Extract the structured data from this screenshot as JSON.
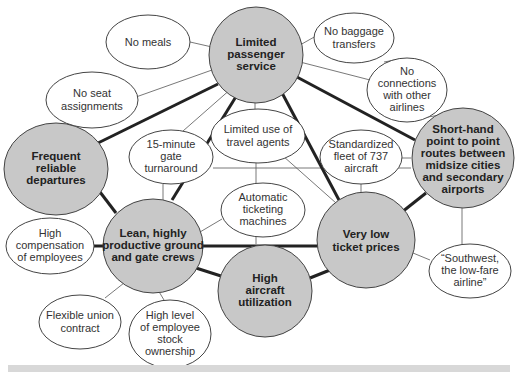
{
  "diagram": {
    "type": "activity-system-map",
    "colors": {
      "core_fill": "#c8c8c8",
      "support_fill": "#ffffff",
      "strong_link": "#222222",
      "weak_link": "#555555",
      "bottom_band": "#d8d8d8"
    },
    "nodes": {
      "limited_passenger_service": {
        "lines": [
          "Limited",
          "passenger",
          "service"
        ],
        "kind": "core"
      },
      "no_meals": {
        "lines": [
          "No meals"
        ],
        "kind": "support"
      },
      "no_baggage_transfers": {
        "lines": [
          "No baggage",
          "transfers"
        ],
        "kind": "support"
      },
      "no_connections": {
        "lines": [
          "No",
          "connections",
          "with other",
          "airlines"
        ],
        "kind": "support"
      },
      "no_seat_assignments": {
        "lines": [
          "No seat",
          "assignments"
        ],
        "kind": "support"
      },
      "frequent_reliable_departures": {
        "lines": [
          "Frequent",
          "reliable",
          "departures"
        ],
        "kind": "core"
      },
      "gate_turnaround": {
        "lines": [
          "15-minute",
          "gate",
          "turnaround"
        ],
        "kind": "support"
      },
      "limited_travel_agents": {
        "lines": [
          "Limited use of",
          "travel agents"
        ],
        "kind": "support"
      },
      "standardized_fleet": {
        "lines": [
          "Standardized",
          "fleet of 737",
          "aircraft"
        ],
        "kind": "support"
      },
      "short_haul_routes": {
        "lines": [
          "Short-hand",
          "point to point",
          "routes between",
          "midsize cities",
          "and secondary",
          "airports"
        ],
        "kind": "core"
      },
      "automatic_ticketing": {
        "lines": [
          "Automatic",
          "ticketing",
          "machines"
        ],
        "kind": "support"
      },
      "high_compensation": {
        "lines": [
          "High",
          "compensation",
          "of employees"
        ],
        "kind": "support"
      },
      "lean_crews": {
        "lines": [
          "Lean, highly",
          "productive ground",
          "and gate crews"
        ],
        "kind": "core"
      },
      "very_low_prices": {
        "lines": [
          "Very low",
          "ticket prices"
        ],
        "kind": "core"
      },
      "high_utilization": {
        "lines": [
          "High",
          "aircraft",
          "utilization"
        ],
        "kind": "core"
      },
      "southwest_slogan": {
        "lines": [
          "“Southwest,",
          "the low-fare",
          "airline”"
        ],
        "kind": "support"
      },
      "flexible_union": {
        "lines": [
          "Flexible union",
          "contract"
        ],
        "kind": "support"
      },
      "stock_ownership": {
        "lines": [
          "High level",
          "of employee",
          "stock",
          "ownership"
        ],
        "kind": "support"
      }
    },
    "edges": [
      {
        "from": "limited_passenger_service",
        "to": "frequent_reliable_departures",
        "weight": "strong"
      },
      {
        "from": "limited_passenger_service",
        "to": "lean_crews",
        "weight": "strong"
      },
      {
        "from": "limited_passenger_service",
        "to": "very_low_prices",
        "weight": "strong"
      },
      {
        "from": "limited_passenger_service",
        "to": "short_haul_routes",
        "weight": "strong"
      },
      {
        "from": "frequent_reliable_departures",
        "to": "lean_crews",
        "weight": "strong"
      },
      {
        "from": "lean_crews",
        "to": "very_low_prices",
        "weight": "strong"
      },
      {
        "from": "lean_crews",
        "to": "high_utilization",
        "weight": "strong"
      },
      {
        "from": "high_utilization",
        "to": "very_low_prices",
        "weight": "strong"
      },
      {
        "from": "very_low_prices",
        "to": "short_haul_routes",
        "weight": "strong"
      },
      {
        "from": "lean_crews",
        "to": "high_compensation",
        "weight": "strong"
      },
      {
        "from": "limited_passenger_service",
        "to": "no_meals",
        "weight": "weak"
      },
      {
        "from": "limited_passenger_service",
        "to": "no_seat_assignments",
        "weight": "weak"
      },
      {
        "from": "limited_passenger_service",
        "to": "no_baggage_transfers",
        "weight": "weak"
      },
      {
        "from": "limited_passenger_service",
        "to": "no_connections",
        "weight": "weak"
      },
      {
        "from": "limited_passenger_service",
        "to": "gate_turnaround",
        "weight": "weak"
      },
      {
        "from": "limited_passenger_service",
        "to": "limited_travel_agents",
        "weight": "weak"
      },
      {
        "from": "no_baggage_transfers",
        "to": "no_connections",
        "weight": "weak"
      },
      {
        "from": "no_connections",
        "to": "short_haul_routes",
        "weight": "weak"
      },
      {
        "from": "gate_turnaround",
        "to": "short_haul_routes",
        "weight": "weak"
      },
      {
        "from": "gate_turnaround",
        "to": "lean_crews",
        "weight": "weak"
      },
      {
        "from": "limited_travel_agents",
        "to": "automatic_ticketing",
        "weight": "weak"
      },
      {
        "from": "limited_travel_agents",
        "to": "very_low_prices",
        "weight": "weak"
      },
      {
        "from": "standardized_fleet",
        "to": "very_low_prices",
        "weight": "weak"
      },
      {
        "from": "standardized_fleet",
        "to": "short_haul_routes",
        "weight": "weak"
      },
      {
        "from": "automatic_ticketing",
        "to": "lean_crews",
        "weight": "weak"
      },
      {
        "from": "automatic_ticketing",
        "to": "high_utilization",
        "weight": "weak"
      },
      {
        "from": "very_low_prices",
        "to": "southwest_slogan",
        "weight": "weak"
      },
      {
        "from": "short_haul_routes",
        "to": "southwest_slogan",
        "weight": "weak"
      },
      {
        "from": "lean_crews",
        "to": "flexible_union",
        "weight": "weak"
      },
      {
        "from": "lean_crews",
        "to": "stock_ownership",
        "weight": "weak"
      }
    ]
  }
}
